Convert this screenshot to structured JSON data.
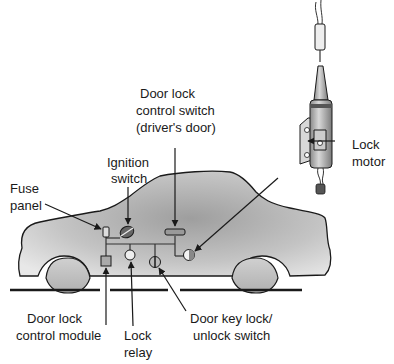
{
  "diagram": {
    "type": "vehicle power door lock system layout",
    "labels": {
      "door_lock_control_switch": [
        "Door lock",
        "control switch",
        "(driver's door)"
      ],
      "ignition_switch": [
        "Ignition",
        "switch"
      ],
      "fuse_panel": [
        "Fuse",
        "panel"
      ],
      "lock_motor": [
        "Lock",
        "motor"
      ],
      "door_lock_control_module": [
        "Door lock",
        "control module"
      ],
      "lock_relay": [
        "Lock",
        "relay"
      ],
      "door_key_lock_unlock_switch": [
        "Door key lock/",
        "unlock switch"
      ]
    },
    "components": [
      {
        "id": "fuse-panel",
        "label": "Fuse panel"
      },
      {
        "id": "ignition-switch",
        "label": "Ignition switch"
      },
      {
        "id": "door-lock-control-switch",
        "label": "Door lock control switch (driver's door)"
      },
      {
        "id": "lock-motor",
        "label": "Lock motor"
      },
      {
        "id": "door-lock-control-module",
        "label": "Door lock control module"
      },
      {
        "id": "lock-relay",
        "label": "Lock relay"
      },
      {
        "id": "door-key-lock-unlock-switch",
        "label": "Door key lock/unlock switch"
      }
    ],
    "colors": {
      "line": "#1a1a1a",
      "car_fill_light": "#e6e6e6",
      "car_fill_dark": "#a8a8a8",
      "ground": "#1a1a1a"
    }
  }
}
